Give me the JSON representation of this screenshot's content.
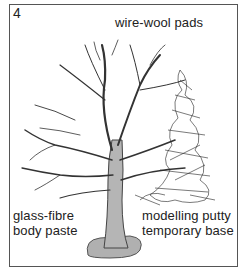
{
  "figure": {
    "number": "4",
    "labels": {
      "wire_wool": "wire-wool pads",
      "glass_fibre": [
        "glass-fibre",
        "body paste"
      ],
      "modelling_putty": [
        "modelling putty",
        "temporary base"
      ]
    },
    "colors": {
      "border": "#555555",
      "branch": "#333333",
      "trunk_fill": "#b5b5b5",
      "base_fill": "#b0b0b0"
    }
  }
}
